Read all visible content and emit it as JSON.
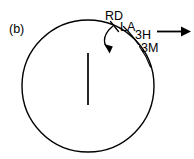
{
  "figure": {
    "panel_label": "(b)",
    "background_color": "#ffffff",
    "stroke_color": "#000000",
    "annotations": {
      "rd": "RD",
      "la": "LA",
      "three_h": "3H",
      "three_m": "3M"
    },
    "shapes": {
      "circle": {
        "cx": 88,
        "cy": 86,
        "r": 66,
        "stroke_width": 1.4
      },
      "radius_line": {
        "x": 88,
        "y1": 53,
        "y2": 105,
        "stroke_width": 1.6
      },
      "rd_tick": {
        "x1": 111,
        "y1": 22,
        "x2": 118,
        "y2": 31,
        "stroke_width": 1.3
      },
      "curved_arrow": {
        "path": "M 113,27 C 105,33 102,42 109,50",
        "head_tip": [
          110,
          53
        ],
        "direction": "clockwise-inward"
      },
      "leader_3h": {
        "path": "M 124,27 C 130,33 136,40 140,47"
      },
      "leader_3m": {
        "path": "M 140,47 C 145,54 149,62 151,70"
      },
      "straight_arrow": {
        "x1": 156,
        "y1": 32,
        "x2": 188,
        "y2": 32,
        "head_tip": [
          190,
          32
        ]
      }
    }
  }
}
